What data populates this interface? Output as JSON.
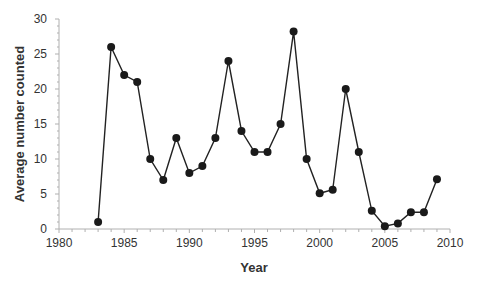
{
  "chart_data": {
    "type": "line",
    "title": "",
    "xlabel": "Year",
    "ylabel": "Average number counted",
    "xlim": [
      1980,
      2010
    ],
    "ylim": [
      0,
      30
    ],
    "xticks": [
      1980,
      1985,
      1990,
      1995,
      2000,
      2005,
      2010
    ],
    "yticks": [
      0,
      5,
      10,
      15,
      20,
      25,
      30
    ],
    "grid": false,
    "legend": null,
    "series": [
      {
        "name": "Average number counted",
        "marker": "circle",
        "color": "#1a1a1a",
        "x": [
          1983,
          1984,
          1985,
          1986,
          1987,
          1988,
          1989,
          1990,
          1991,
          1992,
          1993,
          1994,
          1995,
          1996,
          1997,
          1998,
          1999,
          2000,
          2001,
          2002,
          2003,
          2004,
          2005,
          2006,
          2007,
          2008,
          2009
        ],
        "values": [
          1,
          26,
          22,
          21,
          10,
          7,
          13,
          8,
          9,
          13,
          24,
          14,
          11,
          11,
          15,
          28.2,
          10,
          5.1,
          5.6,
          20,
          11,
          2.6,
          0.4,
          0.8,
          2.4,
          2.4,
          7.1
        ]
      }
    ]
  }
}
